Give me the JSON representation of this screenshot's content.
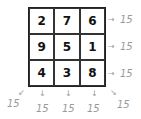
{
  "grid": {
    "rows": [
      [
        "2",
        "7",
        "6"
      ],
      [
        "9",
        "5",
        "1"
      ],
      [
        "4",
        "3",
        "8"
      ]
    ]
  },
  "row_sums": [
    "15",
    "15",
    "15"
  ],
  "column_sums": [
    "15",
    "15",
    "15"
  ],
  "diagonal_sums": {
    "anti_diagonal": "15",
    "main_diagonal": "15"
  },
  "colors": {
    "grid_line": "#222222",
    "digit": "#111111",
    "sum_label": "#9a9a9a"
  }
}
